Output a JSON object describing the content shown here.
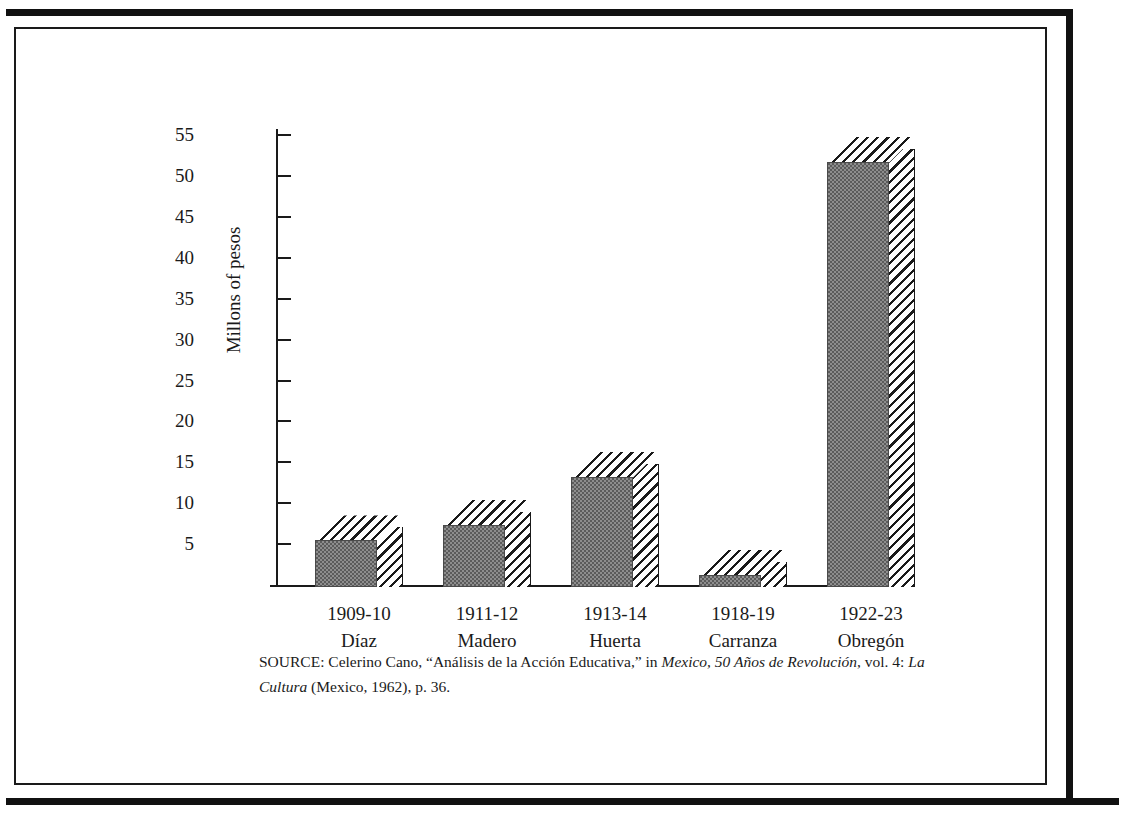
{
  "chart_data": {
    "type": "bar",
    "title": "",
    "xlabel": "",
    "ylabel": "Millons of pesos",
    "ylim": [
      0,
      55
    ],
    "ytick_step": 5,
    "grid": false,
    "legend": null,
    "categories": [
      "1909-10",
      "1911-12",
      "1913-14",
      "1918-19",
      "1922-23"
    ],
    "category_sublabels": [
      "Díaz",
      "Madero",
      "Huerta",
      "Carranza",
      "Obregón"
    ],
    "values": [
      5.7,
      7.6,
      13.5,
      1.5,
      52.0
    ],
    "ytick_labels": [
      "55",
      "50",
      "45",
      "40",
      "35",
      "30",
      "25",
      "20",
      "15",
      "10",
      "5"
    ],
    "bar_style": "3d-hatched",
    "colors": {
      "bar_front": "#8d8d8d",
      "bar_hatch": "#1a1a1a",
      "axis": "#1a1a1a",
      "background": "#ffffff"
    }
  },
  "axis": {
    "y_label": "Millons of pesos",
    "ticks": [
      {
        "label": "55",
        "value": 55
      },
      {
        "label": "50",
        "value": 50
      },
      {
        "label": "45",
        "value": 45
      },
      {
        "label": "40",
        "value": 40
      },
      {
        "label": "35",
        "value": 35
      },
      {
        "label": "30",
        "value": 30
      },
      {
        "label": "25",
        "value": 25
      },
      {
        "label": "20",
        "value": 20
      },
      {
        "label": "15",
        "value": 15
      },
      {
        "label": "10",
        "value": 10
      },
      {
        "label": "5",
        "value": 5
      }
    ]
  },
  "bars": [
    {
      "period": "1909-10",
      "name": "Díaz",
      "value": 5.7
    },
    {
      "period": "1911-12",
      "name": "Madero",
      "value": 7.6
    },
    {
      "period": "1913-14",
      "name": "Huerta",
      "value": 13.5
    },
    {
      "period": "1918-19",
      "name": "Carranza",
      "value": 1.5
    },
    {
      "period": "1922-23",
      "name": "Obregón",
      "value": 52.0
    }
  ],
  "source": {
    "prefix": "SOURCE: Celerino Cano, “Análisis de la Acción Educativa,” in ",
    "work_italic_1": "Mexico, 50 Años de Revolución",
    "middle": ", vol. 4: ",
    "work_italic_2": "La Cultura",
    "suffix": " (Mexico, 1962), p. 36."
  }
}
